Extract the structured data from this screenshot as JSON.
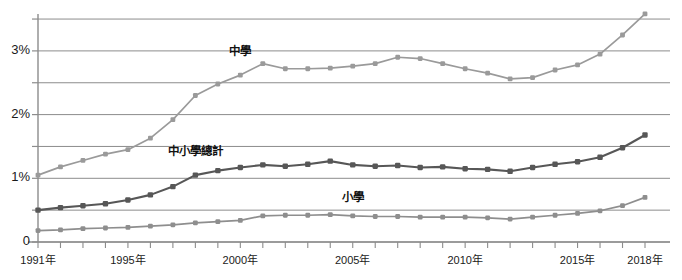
{
  "chart_data": {
    "type": "line",
    "title": "",
    "subtitle": "",
    "xlabel": "",
    "ylabel": "",
    "grid": true,
    "legend_position": "inline-labels",
    "xlim": [
      1991,
      2018
    ],
    "ylim": [
      0,
      3.6
    ],
    "y_gridline_values": [
      0,
      0.5,
      1.0,
      1.5,
      2.0,
      2.5,
      3.0,
      3.5
    ],
    "y_tick_labels": [
      "0",
      "1%",
      "2%",
      "3%"
    ],
    "y_tick_values": [
      0,
      1,
      2,
      3
    ],
    "x": [
      1991,
      1992,
      1993,
      1994,
      1995,
      1996,
      1997,
      1998,
      1999,
      2000,
      2001,
      2002,
      2003,
      2004,
      2005,
      2006,
      2007,
      2008,
      2009,
      2010,
      2011,
      2012,
      2013,
      2014,
      2015,
      2016,
      2017,
      2018
    ],
    "x_tick_labels": [
      "1991年",
      "1995年",
      "2000年",
      "2005年",
      "2010年",
      "2015年",
      "2018年"
    ],
    "x_tick_values": [
      1991,
      1995,
      2000,
      2005,
      2010,
      2015,
      2018
    ],
    "units": "percent",
    "series": [
      {
        "name": "中學",
        "color": "#9a9a9a",
        "label_x": 2000,
        "label_y": 3.02,
        "values": [
          1.05,
          1.18,
          1.28,
          1.38,
          1.45,
          1.63,
          1.92,
          2.3,
          2.48,
          2.62,
          2.8,
          2.72,
          2.72,
          2.73,
          2.76,
          2.8,
          2.9,
          2.88,
          2.8,
          2.72,
          2.65,
          2.56,
          2.58,
          2.7,
          2.78,
          2.95,
          3.25,
          3.58
        ]
      },
      {
        "name": "中小學總計",
        "color": "#575757",
        "label_x": 1998,
        "label_y": 1.45,
        "values": [
          0.5,
          0.54,
          0.57,
          0.6,
          0.66,
          0.74,
          0.87,
          1.05,
          1.12,
          1.17,
          1.21,
          1.19,
          1.22,
          1.27,
          1.21,
          1.19,
          1.2,
          1.17,
          1.18,
          1.15,
          1.14,
          1.11,
          1.17,
          1.22,
          1.26,
          1.33,
          1.48,
          1.68
        ]
      },
      {
        "name": "小學",
        "color": "#8e8e8e",
        "label_x": 2005,
        "label_y": 0.72,
        "values": [
          0.18,
          0.19,
          0.21,
          0.22,
          0.23,
          0.25,
          0.27,
          0.3,
          0.32,
          0.34,
          0.41,
          0.42,
          0.42,
          0.43,
          0.41,
          0.4,
          0.4,
          0.39,
          0.39,
          0.39,
          0.38,
          0.36,
          0.39,
          0.42,
          0.45,
          0.49,
          0.57,
          0.7
        ]
      }
    ]
  },
  "axis": {
    "axis_color": "#8c8c8c",
    "grid_color": "#8c8c8c",
    "text_color": "#1a1a1a"
  }
}
